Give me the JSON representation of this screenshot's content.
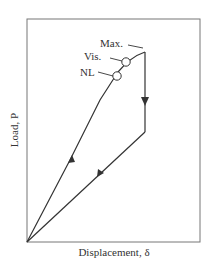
{
  "diagram": {
    "type": "load-displacement curve",
    "axes": {
      "x_label": "Displacement, δ",
      "y_label": "Load, P"
    },
    "annotations": [
      {
        "id": "max",
        "label": "Max."
      },
      {
        "id": "vis",
        "label": "Vis."
      },
      {
        "id": "nl",
        "label": "NL"
      }
    ],
    "colors": {
      "line": "#333333",
      "frame": "#777777",
      "background": "#ffffff"
    }
  }
}
